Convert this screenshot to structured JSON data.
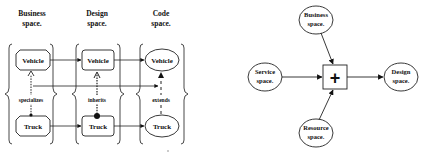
{
  "left_diagram": {
    "headers": [
      {
        "line1": "Business",
        "line2": "space."
      },
      {
        "line1": "Design",
        "line2": "space."
      },
      {
        "line1": "Code",
        "line2": "space."
      }
    ],
    "business": {
      "top": "Vehicle",
      "bottom": "Truck",
      "relation": "specializes"
    },
    "design": {
      "top": "Vehicle",
      "bottom": "Truck",
      "relation": "inherits"
    },
    "code": {
      "top": "Vehicle",
      "bottom": "Truck",
      "relation": "extends"
    }
  },
  "right_diagram": {
    "business": {
      "line1": "Business",
      "line2": "space."
    },
    "service": {
      "line1": "Service",
      "line2": "space."
    },
    "resource": {
      "line1": "Resource",
      "line2": "space."
    },
    "design": {
      "line1": "Design",
      "line2": "space."
    },
    "operator": "+"
  }
}
